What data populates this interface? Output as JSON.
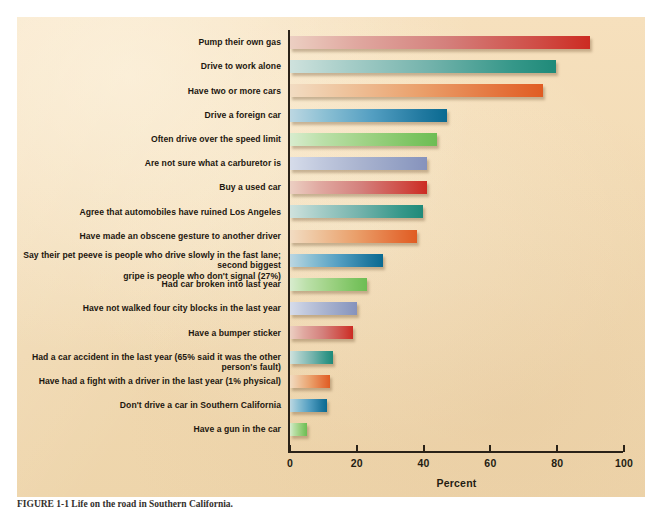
{
  "chart_data": {
    "type": "bar",
    "orientation": "horizontal",
    "title": "",
    "xlabel": "Percent",
    "ylabel": "",
    "xlim": [
      0,
      100
    ],
    "xticks": [
      0,
      20,
      40,
      60,
      80,
      100
    ],
    "grid": false,
    "legend": null,
    "categories": [
      "Pump their own gas",
      "Drive to work alone",
      "Have two or more cars",
      "Drive a foreign car",
      "Often drive over the speed limit",
      "Are not sure what a carburetor is",
      "Buy a used car",
      "Agree that automobiles have ruined Los Angeles",
      "Have made an obscene gesture to another driver",
      "Say their pet peeve is people who drive slowly in the fast lane; second biggest\ngripe  is people who don't signal (27%)",
      "Had car broken into last year",
      "Have not walked four city blocks in the last year",
      "Have a bumper sticker",
      "Had a car accident in the last year (65% said it was the other person's fault)",
      "Have had a fight with a driver in the last year (1% physical)",
      "Don't drive a car in Southern California",
      "Have a gun in the car"
    ],
    "values": [
      90,
      80,
      76,
      47,
      44,
      41,
      41,
      40,
      38,
      28,
      23,
      20,
      19,
      13,
      12,
      11,
      5
    ],
    "colors": [
      "#cc2b22",
      "#1f8a79",
      "#e05c22",
      "#0a6a91",
      "#6dbd54",
      "#8692bc",
      "#cc2b22",
      "#1f8a79",
      "#e05c22",
      "#0a6a91",
      "#6dbd54",
      "#8692bc",
      "#cc2b22",
      "#1f8a79",
      "#e05c22",
      "#0a6a91",
      "#6dbd54"
    ],
    "color_classes": [
      "c-red",
      "c-teal",
      "c-orange",
      "c-blue",
      "c-green",
      "c-lavender",
      "c-red",
      "c-teal",
      "c-orange",
      "c-blue",
      "c-green",
      "c-lavender",
      "c-red",
      "c-teal",
      "c-orange",
      "c-blue",
      "c-green"
    ]
  },
  "figure": {
    "background_color": "#f2dcb4",
    "axis_color": "#2a2218",
    "caption": "FIGURE 1-1  Life on the road in Southern California."
  }
}
